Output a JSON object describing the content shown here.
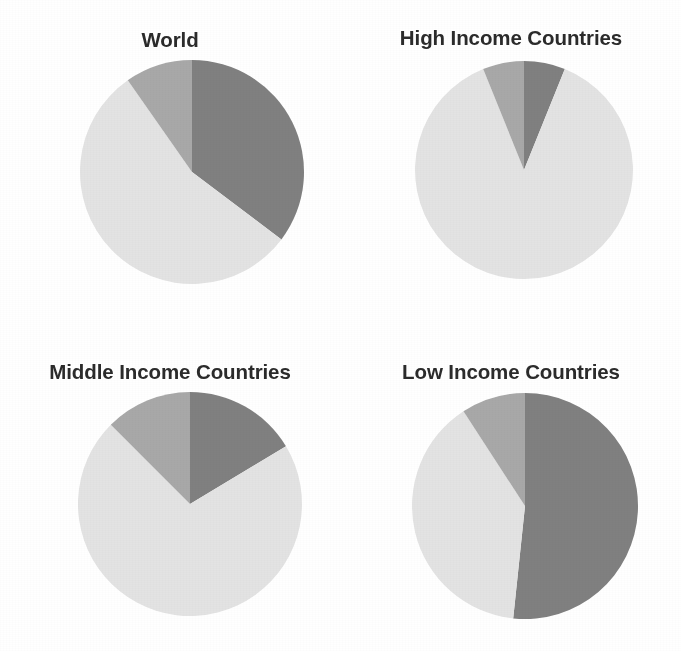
{
  "figure": {
    "width": 681,
    "height": 651,
    "background": "#ffffff",
    "title_color": "#2b2b2b"
  },
  "palette": {
    "dark": "#808080",
    "medium": "#a8a8a8",
    "light": "#e3e3e3"
  },
  "panels": [
    {
      "title": "World",
      "title_name": "panel-title-world",
      "cx": 192,
      "cy": 172,
      "r": 112,
      "title_y": 30,
      "box": {
        "left": 0,
        "top": 0,
        "width": 340,
        "height": 330
      }
    },
    {
      "title": "High Income Countries",
      "title_name": "panel-title-high-income",
      "cx": 524,
      "cy": 170,
      "r": 109,
      "title_y": 28,
      "box": {
        "left": 341,
        "top": 0,
        "width": 340,
        "height": 330
      }
    },
    {
      "title": "Middle Income Countries",
      "title_name": "panel-title-middle-income",
      "cx": 190,
      "cy": 504,
      "r": 112,
      "title_y": 362,
      "box": {
        "left": 0,
        "top": 331,
        "width": 340,
        "height": 320
      }
    },
    {
      "title": "Low Income Countries",
      "title_name": "panel-title-low-income",
      "cx": 525,
      "cy": 506,
      "r": 113,
      "title_y": 362,
      "box": {
        "left": 341,
        "top": 331,
        "width": 340,
        "height": 320
      }
    }
  ],
  "chart_data": {
    "type": "pie",
    "title": "",
    "subtitle": "",
    "legend_position": "none",
    "grid": false,
    "series_names": [
      "dark",
      "medium",
      "light"
    ],
    "series_colors": [
      "#808080",
      "#a8a8a8",
      "#e3e3e3"
    ],
    "start_angle_deg": 0,
    "direction": "clockwise",
    "charts": [
      {
        "title": "World",
        "labels": [
          "dark",
          "medium",
          "light"
        ],
        "angles_deg": [
          127,
          35,
          198
        ],
        "values_pct": [
          35.3,
          9.7,
          55.0
        ],
        "slices": [
          {
            "label": "dark",
            "color": "#808080",
            "start_deg": 0,
            "end_deg": 127,
            "sweep_deg": 127,
            "pct": 35.3
          },
          {
            "label": "light",
            "color": "#e3e3e3",
            "start_deg": 127,
            "end_deg": 325,
            "sweep_deg": 198,
            "pct": 55.0
          },
          {
            "label": "medium",
            "color": "#a8a8a8",
            "start_deg": 325,
            "end_deg": 360,
            "sweep_deg": 35,
            "pct": 9.7
          }
        ]
      },
      {
        "title": "High Income Countries",
        "labels": [
          "dark",
          "medium",
          "light"
        ],
        "angles_deg": [
          22,
          22,
          316
        ],
        "values_pct": [
          6.1,
          6.1,
          87.8
        ],
        "slices": [
          {
            "label": "dark",
            "color": "#808080",
            "start_deg": 0,
            "end_deg": 22,
            "sweep_deg": 22,
            "pct": 6.1
          },
          {
            "label": "light",
            "color": "#e3e3e3",
            "start_deg": 22,
            "end_deg": 338,
            "sweep_deg": 316,
            "pct": 87.8
          },
          {
            "label": "medium",
            "color": "#a8a8a8",
            "start_deg": 338,
            "end_deg": 360,
            "sweep_deg": 22,
            "pct": 6.1
          }
        ]
      },
      {
        "title": "Middle Income Countries",
        "labels": [
          "dark",
          "medium",
          "light"
        ],
        "angles_deg": [
          59,
          45,
          256
        ],
        "values_pct": [
          16.4,
          12.5,
          71.1
        ],
        "slices": [
          {
            "label": "dark",
            "color": "#808080",
            "start_deg": 0,
            "end_deg": 59,
            "sweep_deg": 59,
            "pct": 16.4
          },
          {
            "label": "light",
            "color": "#e3e3e3",
            "start_deg": 59,
            "end_deg": 315,
            "sweep_deg": 256,
            "pct": 71.1
          },
          {
            "label": "medium",
            "color": "#a8a8a8",
            "start_deg": 315,
            "end_deg": 360,
            "sweep_deg": 45,
            "pct": 12.5
          }
        ]
      },
      {
        "title": "Low Income Countries",
        "labels": [
          "dark",
          "medium",
          "light"
        ],
        "angles_deg": [
          186,
          33,
          141
        ],
        "values_pct": [
          51.7,
          9.2,
          39.1
        ],
        "slices": [
          {
            "label": "dark",
            "color": "#808080",
            "start_deg": 0,
            "end_deg": 186,
            "sweep_deg": 186,
            "pct": 51.7
          },
          {
            "label": "light",
            "color": "#e3e3e3",
            "start_deg": 186,
            "end_deg": 327,
            "sweep_deg": 141,
            "pct": 39.1
          },
          {
            "label": "medium",
            "color": "#a8a8a8",
            "start_deg": 327,
            "end_deg": 360,
            "sweep_deg": 33,
            "pct": 9.2
          }
        ]
      }
    ]
  }
}
